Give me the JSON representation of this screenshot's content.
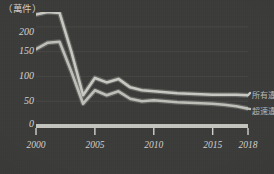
{
  "chart_data": {
    "type": "line",
    "title": "",
    "subtitle": "",
    "unit_label": "（萬件）",
    "xlabel": "",
    "ylabel": "",
    "x": [
      2000,
      2001,
      2002,
      2003,
      2004,
      2005,
      2006,
      2007,
      2008,
      2009,
      2010,
      2011,
      2012,
      2013,
      2014,
      2015,
      2016,
      2017,
      2018
    ],
    "xlim": [
      2000,
      2018
    ],
    "ylim": [
      0,
      230
    ],
    "xticks": [
      "2000",
      "2005",
      "2010",
      "2015",
      "2018"
    ],
    "xtick_values": [
      2000,
      2005,
      2010,
      2015,
      2018
    ],
    "yticks": [
      "0",
      "50",
      "100",
      "150",
      "200"
    ],
    "ytick_values": [
      0,
      50,
      100,
      150,
      200
    ],
    "grid": true,
    "grid_axis": "y",
    "legend_position": "right",
    "series": [
      {
        "name": "所有違規",
        "color": "#c9c9c3",
        "values": [
          225,
          230,
          228,
          150,
          62,
          97,
          88,
          95,
          78,
          72,
          70,
          68,
          66,
          65,
          64,
          63,
          63,
          63,
          62
        ]
      },
      {
        "name": "超速違規",
        "color": "#c0c0ba",
        "values": [
          155,
          168,
          170,
          110,
          45,
          72,
          62,
          70,
          55,
          50,
          52,
          50,
          48,
          47,
          46,
          45,
          43,
          40,
          35
        ]
      }
    ]
  },
  "axis": {
    "baseline_color": "#c5c5bf",
    "tick_color": "#d2d2cd"
  },
  "style": {
    "background": "#3b3b3a",
    "grid_color": "#4a4a48",
    "text_color": "#d2d2cd"
  }
}
